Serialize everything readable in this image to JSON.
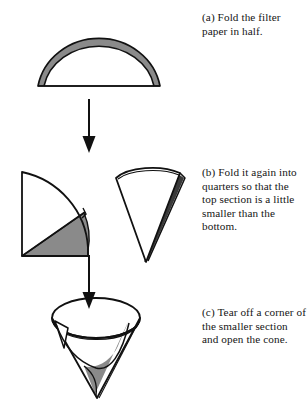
{
  "figure": {
    "background_color": "#ffffff",
    "ink_color": "#111111",
    "shade_color": "#8a8a8a"
  },
  "steps": [
    {
      "id": "a",
      "label": "(a)",
      "caption": "(a) Fold the filter paper in half.",
      "illustration": "semicircle-folded-in-half",
      "shaded_region": "crescent band along the arc"
    },
    {
      "id": "b",
      "label": "(b)",
      "caption": "(b) Fold it again into quarters so that the top section is a little smaller than the bottom.",
      "illustration": "quarter-circle-and-cone-wedge",
      "shaded_region": "lower quarter section and right edge sliver"
    },
    {
      "id": "c",
      "label": "(c)",
      "caption": "(c) Tear off a corner of the smaller section and open the cone.",
      "illustration": "open-cone-with-torn-corner",
      "shaded_region": "inner cone wall"
    }
  ],
  "arrows": [
    {
      "name": "arrow-a-to-b",
      "direction": "down"
    },
    {
      "name": "arrow-b-to-c",
      "direction": "down"
    }
  ]
}
